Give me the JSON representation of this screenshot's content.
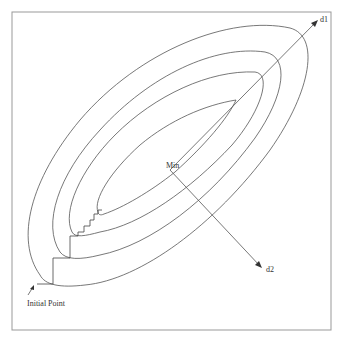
{
  "diagram": {
    "title": "",
    "colors": {
      "background": "#ffffff",
      "frame": "#999999",
      "lines": "#555555",
      "text": "#333333"
    },
    "frame": {
      "x": 12,
      "y": 12,
      "width": 319,
      "height": 318
    },
    "labels": {
      "d1": "d1",
      "d2": "d2",
      "min": "Min",
      "initial_point": "Initial Point"
    },
    "contours": [
      {
        "name": "contour-1-innermost",
        "level": 1
      },
      {
        "name": "contour-2",
        "level": 2
      },
      {
        "name": "contour-3",
        "level": 3
      },
      {
        "name": "contour-4-outermost",
        "level": 4
      }
    ],
    "axes": [
      {
        "name": "d1",
        "from": [
          170,
          170
        ],
        "to": [
          318,
          20
        ],
        "label": "d1"
      },
      {
        "name": "d2",
        "from": [
          170,
          170
        ],
        "to": [
          262,
          268
        ],
        "label": "d2"
      }
    ],
    "path": {
      "name": "coordinate-descent-path",
      "start_label": "Initial Point",
      "description": "staircase path from the initial point toward the minimum"
    }
  }
}
